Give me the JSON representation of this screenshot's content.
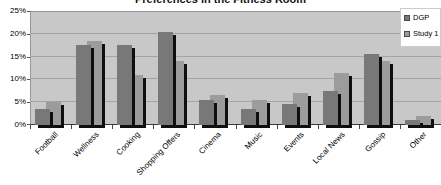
{
  "title": "Preferences in the Fitness Room",
  "colors": {
    "series_dgp": "#787878",
    "series_study1": "#9c9c9c",
    "plot_background": "#c8c8c8",
    "gridline": "#a4a4a4",
    "shadow": "#0f0f0f",
    "text": "#000000"
  },
  "legend": {
    "items": [
      {
        "label": "DGP",
        "color": "#787878"
      },
      {
        "label": "Study 1",
        "color": "#9c9c9c"
      }
    ]
  },
  "chart_data": {
    "type": "bar",
    "title": "Preferences in the Fitness Room",
    "categories": [
      "Football",
      "Wellness",
      "Cooking",
      "Shopping Offers",
      "Cinema",
      "Music",
      "Events",
      "Local News",
      "Gossip",
      "Other"
    ],
    "series": [
      {
        "name": "DGP",
        "color": "#787878",
        "values": [
          3.5,
          17.5,
          17.5,
          20.5,
          5.5,
          3.5,
          4.5,
          7.5,
          15.5,
          1
        ]
      },
      {
        "name": "Study 1",
        "color": "#9c9c9c",
        "values": [
          5,
          18.5,
          11,
          14,
          6.5,
          5.5,
          7,
          11.5,
          14,
          2
        ]
      }
    ],
    "xlabel": "",
    "ylabel": "",
    "ylim": [
      0,
      25
    ],
    "y_ticks": [
      {
        "value": 0,
        "label": "0%"
      },
      {
        "value": 5,
        "label": "5%"
      },
      {
        "value": 10,
        "label": "10%"
      },
      {
        "value": 15,
        "label": "15%"
      },
      {
        "value": 20,
        "label": "20%"
      },
      {
        "value": 25,
        "label": "25%"
      }
    ],
    "grid": "horizontal",
    "legend_position": "top-right",
    "bar_shadow": true,
    "x_label_rotation_deg": -45
  }
}
